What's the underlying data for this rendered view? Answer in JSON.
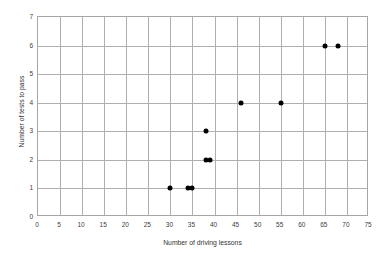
{
  "chart_data": {
    "type": "scatter",
    "title": "",
    "xlabel": "Number of driving lessons",
    "ylabel": "Number of tests to pass",
    "xlim": [
      0,
      75
    ],
    "ylim": [
      0,
      7
    ],
    "xticks": [
      0,
      5,
      10,
      15,
      20,
      25,
      30,
      35,
      40,
      45,
      50,
      55,
      60,
      65,
      70,
      75
    ],
    "yticks": [
      0,
      1,
      2,
      3,
      4,
      5,
      6,
      7
    ],
    "xtick_labels": [
      "0",
      "5",
      "10",
      "15",
      "20",
      "25",
      "30",
      "35",
      "40",
      "45",
      "50",
      "55",
      "60",
      "65",
      "70",
      "75"
    ],
    "ytick_labels": [
      "0",
      "1",
      "2",
      "3",
      "4",
      "5",
      "6",
      "7"
    ],
    "grid": true,
    "legend": null,
    "marker": "filled-circle",
    "marker_color": "#000000",
    "grid_color": "#b0b0b0",
    "frame_color": "#a6a6a6",
    "points": [
      {
        "x": 30,
        "y": 1
      },
      {
        "x": 34,
        "y": 1
      },
      {
        "x": 35,
        "y": 1
      },
      {
        "x": 38,
        "y": 2
      },
      {
        "x": 39,
        "y": 2
      },
      {
        "x": 38,
        "y": 3
      },
      {
        "x": 46,
        "y": 4
      },
      {
        "x": 55,
        "y": 4
      },
      {
        "x": 65,
        "y": 6
      },
      {
        "x": 68,
        "y": 6
      }
    ]
  }
}
